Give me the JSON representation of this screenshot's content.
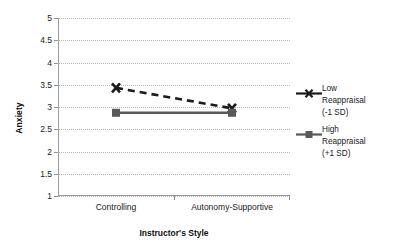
{
  "chart_data": {
    "type": "line",
    "title": "",
    "xlabel": "Instructor's Style",
    "ylabel": "Anxiety",
    "categories": [
      "Controlling",
      "Autonomy-Supportive"
    ],
    "ylim": [
      1,
      5
    ],
    "yticks": [
      "5",
      "4.5",
      "4",
      "3.5",
      "3",
      "2.5",
      "2",
      "1.5",
      "1"
    ],
    "ytick_values": [
      5,
      4.5,
      4,
      3.5,
      3,
      2.5,
      2,
      1.5,
      1
    ],
    "grid": true,
    "legend_position": "right",
    "series": [
      {
        "name": "Low Reappraisal (-1 SD)",
        "label_line1": "Low",
        "label_line2": "Reappraisal",
        "label_line3": "(-1 SD)",
        "values": [
          3.43,
          2.97
        ],
        "marker": "x",
        "linestyle": "dashed",
        "color": "#1a1a1a"
      },
      {
        "name": "High Reappraisal (+1 SD)",
        "label_line1": "High",
        "label_line2": "Reappraisal",
        "label_line3": "(+1 SD)",
        "values": [
          2.87,
          2.87
        ],
        "marker": "square",
        "linestyle": "solid",
        "color": "#595959"
      }
    ]
  },
  "colors": {
    "axis": "#9a9a9a",
    "grid": "#b6b6b6",
    "text": "#1a1a1a",
    "low_series": "#1a1a1a",
    "high_series": "#595959",
    "background": "#ffffff"
  }
}
